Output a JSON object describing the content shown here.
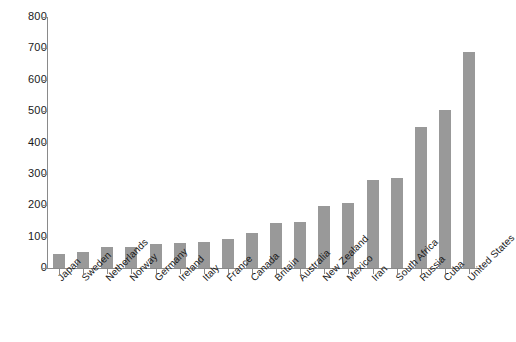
{
  "chart_data": {
    "type": "bar",
    "title": "",
    "subtitle": "",
    "xlabel": "",
    "ylabel": "",
    "ylim": [
      0,
      800
    ],
    "ytick_values": [
      0,
      100,
      200,
      300,
      400,
      500,
      600,
      700,
      800
    ],
    "ytick_labels": [
      "0",
      "100",
      "200",
      "300",
      "400",
      "500",
      "600",
      "700",
      "800"
    ],
    "grid": false,
    "legend": false,
    "bar_color": "#999999",
    "axis_color": "#8a8a8a",
    "background": "#ffffff",
    "categories": [
      "Japan",
      "Sweden",
      "Netherlands",
      "Norway",
      "Germany",
      "Ireland",
      "Italy",
      "France",
      "Canada",
      "Britain",
      "Australia",
      "New Zealand",
      "Mexico",
      "Iran",
      "South Africa",
      "Russia",
      "Cuba",
      "United States"
    ],
    "values": [
      45,
      51,
      68,
      68,
      75,
      80,
      83,
      93,
      113,
      142,
      147,
      199,
      208,
      281,
      287,
      448,
      505,
      690
    ]
  }
}
